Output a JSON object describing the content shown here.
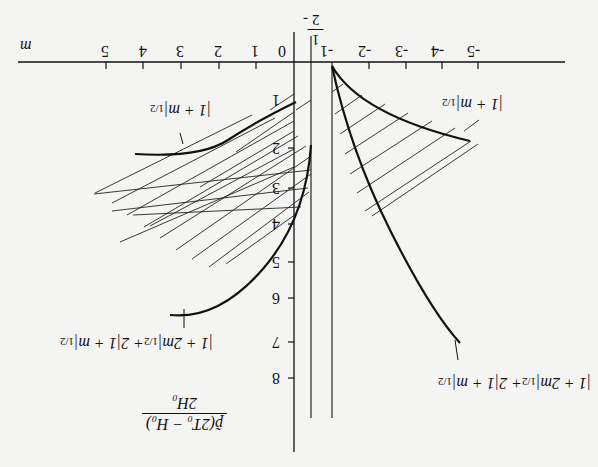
{
  "figure": {
    "orientation": "rotated 180 degrees",
    "x_axis": {
      "label": "m",
      "ticks_positive": [
        "0",
        "1",
        "2",
        "3",
        "4",
        "5"
      ],
      "ticks_negative": [
        "-1",
        "-2",
        "-3",
        "-4",
        "-5"
      ],
      "special_mark": {
        "label_num": "1",
        "label_den": "2",
        "sign": "-"
      }
    },
    "y_axis": {
      "label_numerator": "p̃(2T₀ − H₀)",
      "label_denominator": "2H₀",
      "ticks": [
        "1",
        "2",
        "3",
        "4",
        "5",
        "6",
        "7",
        "8"
      ]
    },
    "curves": [
      {
        "name": "upper-left-bound",
        "label": "|1 + m|",
        "exponent": "1/2"
      },
      {
        "name": "upper-right-bound",
        "label": "|1 + m|",
        "exponent": "1/2"
      },
      {
        "name": "lower-left-bound",
        "label": "|1 + 2m|",
        "exponent1": "1/2",
        "middle": "+ 2|1 + m|",
        "exponent2": "1/2"
      },
      {
        "name": "lower-right-bound",
        "label": "|1 + 2m|",
        "exponent1": "1/2",
        "middle": "+ 2|1 + m|",
        "exponent2": "1/2"
      }
    ],
    "regions": [
      "hatched-region-left",
      "hatched-region-right"
    ],
    "asymptotes": [
      "m = -1/2",
      "m = -1"
    ]
  }
}
